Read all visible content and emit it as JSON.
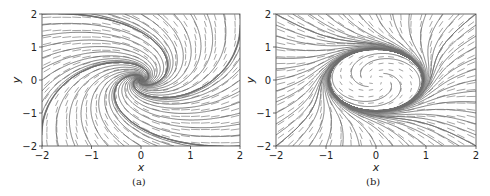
{
  "chart_data": [
    {
      "type": "streamplot",
      "panel_label": "(a)",
      "xlabel": "x",
      "ylabel": "y",
      "xlim": [
        -2,
        2
      ],
      "ylim": [
        -2,
        2
      ],
      "xticks": [
        -2,
        -1,
        0,
        1,
        2
      ],
      "yticks": [
        -2,
        -1,
        0,
        1,
        2
      ],
      "grid": false,
      "description": "Phase portrait with vector field arrows and streamlines spiraling into a stable focus at the origin",
      "field": {
        "kind": "spiral_sink",
        "a": -1.0,
        "w": 1.2
      },
      "equilibrium": [
        0,
        0
      ],
      "line_color": "#6e6e6e",
      "arrow_color": "#9a9a9a"
    },
    {
      "type": "streamplot",
      "panel_label": "(b)",
      "xlabel": "x",
      "ylabel": "y",
      "xlim": [
        -2,
        2
      ],
      "ylim": [
        -2,
        2
      ],
      "xticks": [
        -2,
        -1,
        0,
        1,
        2
      ],
      "yticks": [
        -2,
        -1,
        0,
        1,
        2
      ],
      "grid": false,
      "description": "Phase portrait with streamlines converging onto an elliptical limit cycle (x-radius ~1, y-radius ~1); interior trajectories spiral outward",
      "field": {
        "kind": "limit_cycle",
        "rx": 1.0,
        "ry": 1.0,
        "tilt": 0.35,
        "w": 1.2
      },
      "line_color": "#6e6e6e",
      "arrow_color": "#9a9a9a"
    }
  ],
  "panels": {
    "a": {
      "caption": "(a)",
      "xlabel": "x",
      "ylabel": "y",
      "xticks": [
        "−2",
        "−1",
        "0",
        "1",
        "2"
      ],
      "yticks": [
        "2",
        "1",
        "0",
        "−1",
        "−2"
      ]
    },
    "b": {
      "caption": "(b)",
      "xlabel": "x",
      "ylabel": "y",
      "xticks": [
        "−2",
        "−1",
        "0",
        "1",
        "2"
      ],
      "yticks": [
        "2",
        "1",
        "0",
        "−1",
        "−2"
      ]
    }
  }
}
